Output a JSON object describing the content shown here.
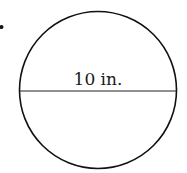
{
  "diagram": {
    "shape": "circle",
    "diameter_label": "10 in.",
    "stroke_color": "#111111",
    "bullet": "•"
  }
}
